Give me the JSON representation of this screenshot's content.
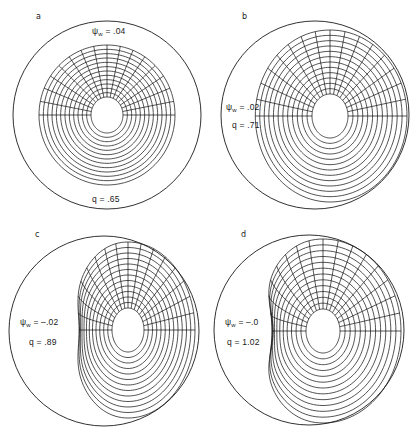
{
  "figure": {
    "stroke_color": "#1a1a1a",
    "background": "#ffffff"
  },
  "panels": [
    {
      "letter": "a",
      "psi_symbol": "ψ",
      "psi_sub": "w",
      "psi_value": "= .04",
      "q_label": "q = .65",
      "wall": {
        "cx": 107,
        "cy": 115,
        "r": 94
      },
      "surfaces": {
        "cx": 107,
        "cy": 115,
        "inner_rx": 16,
        "inner_ry": 18,
        "outer_rx": 68,
        "outer_ry": 70,
        "count": 12,
        "left_flatten": 0,
        "left_indent": 0
      },
      "letter_pos": {
        "x": 36,
        "y": 12
      },
      "psi_pos": {
        "x": 92,
        "y": 26
      },
      "q_pos": {
        "x": 92,
        "y": 194
      }
    },
    {
      "letter": "b",
      "psi_symbol": "ψ",
      "psi_sub": "w",
      "psi_value": "= .02",
      "q_label": "q = .71",
      "wall": {
        "cx": 315,
        "cy": 115,
        "r": 94
      },
      "surfaces": {
        "cx": 330,
        "cy": 116,
        "inner_rx": 18,
        "inner_ry": 22,
        "outer_rx": 77,
        "outer_ry": 86,
        "count": 12,
        "left_flatten": 0.05,
        "left_indent": 0
      },
      "letter_pos": {
        "x": 242,
        "y": 12
      },
      "psi_pos": {
        "x": 226,
        "y": 102
      },
      "q_pos": {
        "x": 232,
        "y": 120
      }
    },
    {
      "letter": "c",
      "psi_symbol": "ψ",
      "psi_sub": "w",
      "psi_value": "= –.02",
      "q_label": "q = .89",
      "wall": {
        "cx": 104,
        "cy": 331,
        "r": 95
      },
      "surfaces": {
        "cx": 128,
        "cy": 330,
        "inner_rx": 16,
        "inner_ry": 22,
        "outer_rx": 67,
        "outer_ry": 88,
        "count": 12,
        "left_flatten": 0.25,
        "left_indent": 0.12
      },
      "letter_pos": {
        "x": 35,
        "y": 230
      },
      "psi_pos": {
        "x": 20,
        "y": 317
      },
      "q_pos": {
        "x": 29,
        "y": 337
      }
    },
    {
      "letter": "d",
      "psi_symbol": "ψ",
      "psi_sub": "w",
      "psi_value": "= –.0",
      "q_label": "q = 1.02",
      "wall": {
        "cx": 309,
        "cy": 330,
        "r": 95
      },
      "surfaces": {
        "cx": 323,
        "cy": 331,
        "inner_rx": 17,
        "inner_ry": 22,
        "outer_rx": 78,
        "outer_ry": 92,
        "count": 12,
        "left_flatten": 0.3,
        "left_indent": 0.18
      },
      "letter_pos": {
        "x": 241,
        "y": 230
      },
      "psi_pos": {
        "x": 225,
        "y": 317
      },
      "q_pos": {
        "x": 227,
        "y": 337
      }
    }
  ]
}
